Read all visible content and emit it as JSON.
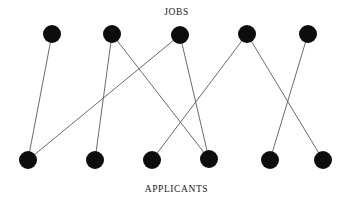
{
  "figure": {
    "width": 353,
    "height": 205,
    "background_color": "#ffffff"
  },
  "top_label": "JOBS",
  "bottom_label": "APPLICANTS",
  "style": {
    "node_color": "#0d0d0d",
    "node_radius": 9,
    "edge_color": "#5a5a5a",
    "edge_width": 0.9,
    "label_color": "#1a1a1a"
  },
  "chart_data": {
    "type": "diagram",
    "subtype": "bipartite-graph",
    "title": "",
    "top_set": {
      "name": "JOBS",
      "count": 5,
      "nodes": [
        {
          "id": "J1",
          "x": 52,
          "y": 34
        },
        {
          "id": "J2",
          "x": 112,
          "y": 34
        },
        {
          "id": "J3",
          "x": 180,
          "y": 35
        },
        {
          "id": "J4",
          "x": 247,
          "y": 34
        },
        {
          "id": "J5",
          "x": 308,
          "y": 34
        }
      ]
    },
    "bottom_set": {
      "name": "APPLICANTS",
      "count": 6,
      "nodes": [
        {
          "id": "A1",
          "x": 28,
          "y": 160
        },
        {
          "id": "A2",
          "x": 95,
          "y": 160
        },
        {
          "id": "A3",
          "x": 152,
          "y": 160
        },
        {
          "id": "A4",
          "x": 209,
          "y": 159
        },
        {
          "id": "A5",
          "x": 270,
          "y": 160
        },
        {
          "id": "A6",
          "x": 323,
          "y": 160
        }
      ]
    },
    "edges": [
      {
        "from": "J1",
        "to": "A1"
      },
      {
        "from": "J2",
        "to": "A2"
      },
      {
        "from": "J2",
        "to": "A4"
      },
      {
        "from": "J3",
        "to": "A1"
      },
      {
        "from": "J3",
        "to": "A4"
      },
      {
        "from": "J4",
        "to": "A3"
      },
      {
        "from": "J4",
        "to": "A6"
      },
      {
        "from": "J5",
        "to": "A5"
      }
    ],
    "edge_count": 8
  }
}
